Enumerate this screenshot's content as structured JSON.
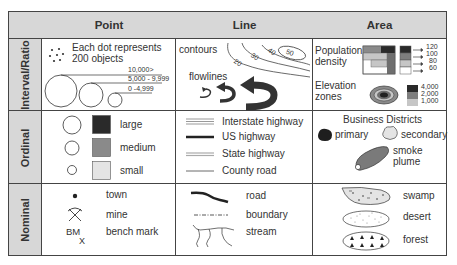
{
  "columns": [
    "Point",
    "Line",
    "Area"
  ],
  "rows": [
    "Interval/Ratio",
    "Ordinal",
    "Nominal"
  ],
  "colors": {
    "header_bg": "#d7d7d7",
    "border": "#444444",
    "dark": "#2a2a2a",
    "medium": "#8a8a8a",
    "light": "#e4e4e4"
  },
  "interval": {
    "point": {
      "dot_caption_1": "Each dot represents",
      "dot_caption_2": "200 objects",
      "circle_legend": [
        "10,000>",
        "5,000 - 9,999",
        "0 -4,999"
      ]
    },
    "line": {
      "contours_label": "contours",
      "contour_values": [
        "20",
        "30",
        "40",
        "50"
      ],
      "flowlines_label": "flowlines"
    },
    "area": {
      "population_label_1": "Population",
      "population_label_2": "density",
      "population_values": [
        "120",
        "100",
        "80",
        "60"
      ],
      "elevation_label_1": "Elevation",
      "elevation_label_2": "zones",
      "elevation_values": [
        "4,000",
        "2,000",
        "1,000"
      ]
    }
  },
  "ordinal": {
    "point": {
      "sizes": [
        "large",
        "medium",
        "small"
      ]
    },
    "line": {
      "roads": [
        "Interstate highway",
        "US highway",
        "State highway",
        "County road"
      ]
    },
    "area": {
      "title": "Business Districts",
      "primary": "primary",
      "secondary": "secondary",
      "smoke_1": "smoke",
      "smoke_2": "plume"
    }
  },
  "nominal": {
    "point": {
      "town": "town",
      "mine": "mine",
      "bench_mark": "bench mark",
      "bm_symbol": "BM",
      "bm_x": "X"
    },
    "line": {
      "road": "road",
      "boundary": "boundary",
      "stream": "stream"
    },
    "area": {
      "swamp": "swamp",
      "desert": "desert",
      "forest": "forest"
    }
  }
}
